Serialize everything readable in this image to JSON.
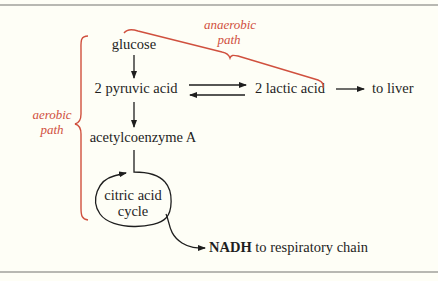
{
  "diagram": {
    "nodes": {
      "glucose": "glucose",
      "pyruvic": "2 pyruvic acid",
      "lactic": "2 lactic acid",
      "liver": "to liver",
      "acetyl": "acetylcoenzyme A",
      "cycle_line1": "citric acid",
      "cycle_line2": "cycle",
      "nadh_bold": "NADH",
      "nadh_rest": " to respiratory chain"
    },
    "labels": {
      "aerobic_line1": "aerobic",
      "aerobic_line2": "path",
      "anaerobic_line1": "anaerobic",
      "anaerobic_line2": "path"
    },
    "edges": [
      {
        "from": "glucose",
        "to": "2 pyruvic acid"
      },
      {
        "from": "2 pyruvic acid",
        "to": "2 lactic acid"
      },
      {
        "from": "2 lactic acid",
        "to": "2 pyruvic acid"
      },
      {
        "from": "2 lactic acid",
        "to": "to liver"
      },
      {
        "from": "2 pyruvic acid",
        "to": "acetylcoenzyme A"
      },
      {
        "from": "acetylcoenzyme A",
        "to": "citric acid cycle"
      },
      {
        "from": "citric acid cycle",
        "to": "NADH to respiratory chain"
      }
    ],
    "colors": {
      "text": "#1e1e1e",
      "annotation": "#d0503e",
      "background": "#fefef6",
      "rule": "#b8b8b2"
    }
  }
}
